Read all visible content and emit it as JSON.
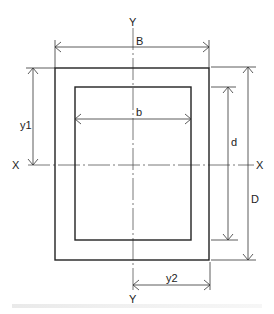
{
  "diagram": {
    "axes": {
      "y_top": "Y",
      "y_bottom": "Y",
      "x_left": "X",
      "x_right": "X"
    },
    "dimensions": {
      "outer_width": "B",
      "inner_width": "b",
      "inner_depth": "d",
      "outer_depth": "D",
      "y1": "y1",
      "y2": "y2"
    },
    "colors": {
      "line": "#222222",
      "axis": "#555555",
      "background": "#ffffff"
    }
  }
}
